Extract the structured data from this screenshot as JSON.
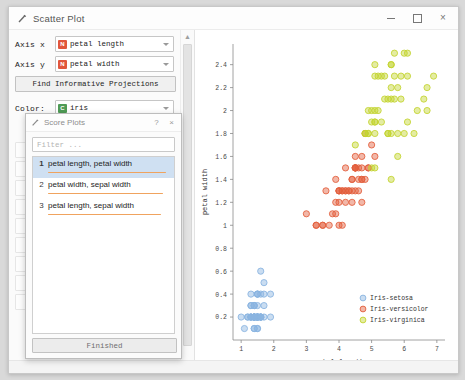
{
  "window": {
    "title": "Scatter Plot",
    "icon": "scatter-plot-icon",
    "minimize": "–",
    "maximize": "□",
    "close": "×"
  },
  "controls": {
    "axis_x": {
      "label": "Axis x",
      "value": "petal length",
      "var_type": "N"
    },
    "axis_y": {
      "label": "Axis y",
      "value": "petal width",
      "var_type": "N"
    },
    "find_button": "Find Informative Projections",
    "color": {
      "label": "Color:",
      "value": "iris",
      "var_type": "C"
    }
  },
  "scrollbar": {
    "up": "▲",
    "down": "▼"
  },
  "dialog": {
    "title": "Score Plots",
    "icon": "scatter-plot-icon",
    "help_button": "?",
    "close_button": "×",
    "filter_placeholder": "Filter ...",
    "items": [
      {
        "rank": "1",
        "label": "petal length, petal width",
        "score": 0.97,
        "selected": true
      },
      {
        "rank": "2",
        "label": "petal width, sepal width",
        "score": 0.94,
        "selected": false
      },
      {
        "rank": "3",
        "label": "petal length, sepal width",
        "score": 0.93,
        "selected": false
      }
    ],
    "finished_button": "Finished"
  },
  "colors": {
    "setosa": "#8ab4e0",
    "versicolor": "#e35f3d",
    "virginica": "#c3d430",
    "score_bar": "#f0a35e",
    "accent_selected": "#cfe0f2"
  },
  "chart_data": {
    "type": "scatter",
    "title": "",
    "xlabel": "petal length",
    "ylabel": "petal width",
    "xlim": [
      0.75,
      7.25
    ],
    "ylim": [
      0.0,
      2.58
    ],
    "xticks": [
      "1",
      "2",
      "3",
      "4",
      "5",
      "6",
      "7"
    ],
    "yticks": [
      "0.2",
      "0.4",
      "0.6",
      "0.8",
      "1",
      "1.2",
      "1.4",
      "1.6",
      "1.8",
      "2",
      "2.2",
      "2.4"
    ],
    "grid": false,
    "legend_position": "bottom-right",
    "series": [
      {
        "name": "Iris-setosa",
        "color": "#8ab4e0",
        "points": [
          [
            1.4,
            0.2
          ],
          [
            1.4,
            0.2
          ],
          [
            1.3,
            0.2
          ],
          [
            1.5,
            0.2
          ],
          [
            1.4,
            0.2
          ],
          [
            1.7,
            0.4
          ],
          [
            1.4,
            0.3
          ],
          [
            1.5,
            0.2
          ],
          [
            1.4,
            0.2
          ],
          [
            1.5,
            0.1
          ],
          [
            1.5,
            0.2
          ],
          [
            1.6,
            0.2
          ],
          [
            1.4,
            0.1
          ],
          [
            1.1,
            0.1
          ],
          [
            1.2,
            0.2
          ],
          [
            1.5,
            0.4
          ],
          [
            1.3,
            0.4
          ],
          [
            1.4,
            0.3
          ],
          [
            1.7,
            0.3
          ],
          [
            1.5,
            0.3
          ],
          [
            1.7,
            0.2
          ],
          [
            1.5,
            0.4
          ],
          [
            1.0,
            0.2
          ],
          [
            1.7,
            0.5
          ],
          [
            1.9,
            0.2
          ],
          [
            1.6,
            0.2
          ],
          [
            1.6,
            0.4
          ],
          [
            1.5,
            0.2
          ],
          [
            1.4,
            0.2
          ],
          [
            1.6,
            0.2
          ],
          [
            1.6,
            0.2
          ],
          [
            1.5,
            0.4
          ],
          [
            1.5,
            0.1
          ],
          [
            1.4,
            0.2
          ],
          [
            1.5,
            0.2
          ],
          [
            1.2,
            0.2
          ],
          [
            1.3,
            0.2
          ],
          [
            1.4,
            0.1
          ],
          [
            1.3,
            0.2
          ],
          [
            1.5,
            0.2
          ],
          [
            1.3,
            0.3
          ],
          [
            1.3,
            0.3
          ],
          [
            1.3,
            0.2
          ],
          [
            1.6,
            0.6
          ],
          [
            1.9,
            0.4
          ],
          [
            1.4,
            0.3
          ],
          [
            1.6,
            0.2
          ],
          [
            1.4,
            0.2
          ],
          [
            1.5,
            0.2
          ],
          [
            1.4,
            0.2
          ]
        ]
      },
      {
        "name": "Iris-versicolor",
        "color": "#e35f3d",
        "points": [
          [
            4.7,
            1.4
          ],
          [
            4.5,
            1.5
          ],
          [
            4.9,
            1.5
          ],
          [
            4.0,
            1.3
          ],
          [
            4.6,
            1.5
          ],
          [
            4.5,
            1.3
          ],
          [
            4.7,
            1.6
          ],
          [
            3.3,
            1.0
          ],
          [
            4.6,
            1.3
          ],
          [
            3.9,
            1.4
          ],
          [
            3.5,
            1.0
          ],
          [
            4.2,
            1.5
          ],
          [
            4.0,
            1.0
          ],
          [
            4.7,
            1.4
          ],
          [
            3.6,
            1.3
          ],
          [
            4.4,
            1.4
          ],
          [
            4.5,
            1.5
          ],
          [
            4.1,
            1.0
          ],
          [
            4.5,
            1.5
          ],
          [
            3.9,
            1.1
          ],
          [
            4.8,
            1.8
          ],
          [
            4.0,
            1.3
          ],
          [
            4.9,
            1.5
          ],
          [
            4.7,
            1.2
          ],
          [
            4.3,
            1.3
          ],
          [
            4.4,
            1.4
          ],
          [
            4.8,
            1.4
          ],
          [
            5.0,
            1.7
          ],
          [
            4.5,
            1.5
          ],
          [
            3.5,
            1.0
          ],
          [
            3.8,
            1.1
          ],
          [
            3.7,
            1.0
          ],
          [
            3.9,
            1.2
          ],
          [
            5.1,
            1.6
          ],
          [
            4.5,
            1.5
          ],
          [
            4.5,
            1.6
          ],
          [
            4.7,
            1.5
          ],
          [
            4.4,
            1.3
          ],
          [
            4.1,
            1.3
          ],
          [
            4.0,
            1.3
          ],
          [
            4.4,
            1.2
          ],
          [
            4.6,
            1.4
          ],
          [
            4.0,
            1.2
          ],
          [
            3.3,
            1.0
          ],
          [
            4.2,
            1.3
          ],
          [
            4.2,
            1.2
          ],
          [
            4.2,
            1.3
          ],
          [
            4.3,
            1.3
          ],
          [
            3.0,
            1.1
          ],
          [
            4.1,
            1.3
          ]
        ]
      },
      {
        "name": "Iris-virginica",
        "color": "#c3d430",
        "points": [
          [
            6.0,
            2.5
          ],
          [
            5.1,
            1.9
          ],
          [
            5.9,
            2.1
          ],
          [
            5.6,
            1.8
          ],
          [
            5.8,
            2.2
          ],
          [
            6.6,
            2.1
          ],
          [
            4.5,
            1.7
          ],
          [
            6.3,
            1.8
          ],
          [
            5.8,
            1.8
          ],
          [
            6.1,
            2.5
          ],
          [
            5.1,
            2.0
          ],
          [
            5.3,
            1.9
          ],
          [
            5.5,
            2.1
          ],
          [
            5.0,
            2.0
          ],
          [
            5.1,
            2.4
          ],
          [
            5.3,
            2.3
          ],
          [
            5.5,
            1.8
          ],
          [
            6.7,
            2.2
          ],
          [
            6.9,
            2.3
          ],
          [
            5.0,
            1.5
          ],
          [
            5.7,
            2.3
          ],
          [
            4.9,
            2.0
          ],
          [
            6.7,
            2.0
          ],
          [
            4.9,
            1.8
          ],
          [
            5.7,
            2.1
          ],
          [
            6.0,
            1.8
          ],
          [
            4.8,
            1.8
          ],
          [
            4.9,
            1.8
          ],
          [
            5.6,
            2.1
          ],
          [
            5.8,
            1.6
          ],
          [
            6.1,
            1.9
          ],
          [
            6.4,
            2.0
          ],
          [
            5.6,
            2.2
          ],
          [
            5.1,
            1.5
          ],
          [
            5.6,
            1.4
          ],
          [
            6.1,
            2.3
          ],
          [
            5.6,
            2.4
          ],
          [
            5.5,
            1.8
          ],
          [
            4.8,
            1.8
          ],
          [
            5.4,
            2.1
          ],
          [
            5.6,
            2.4
          ],
          [
            5.1,
            2.3
          ],
          [
            5.1,
            1.9
          ],
          [
            5.9,
            2.3
          ],
          [
            5.7,
            2.5
          ],
          [
            5.2,
            2.3
          ],
          [
            5.0,
            1.9
          ],
          [
            5.2,
            2.0
          ],
          [
            5.4,
            2.3
          ],
          [
            5.1,
            1.8
          ]
        ]
      }
    ]
  }
}
